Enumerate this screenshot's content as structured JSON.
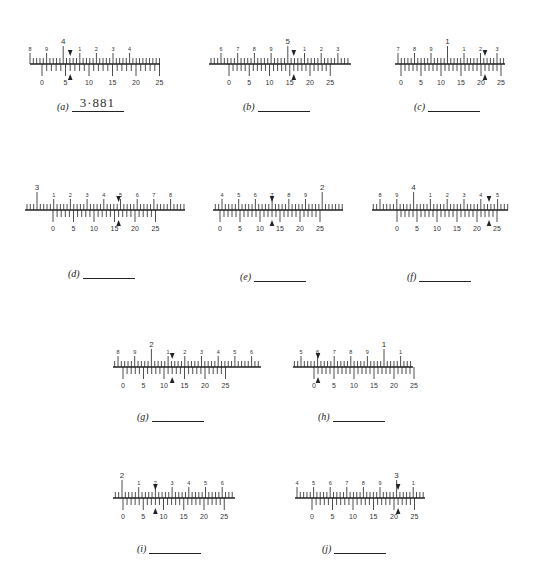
{
  "figure": {
    "colors": {
      "ink": "#222222",
      "background": "#ffffff"
    }
  },
  "panels": [
    {
      "id": "a",
      "caption": "(a)",
      "answer": "3·881",
      "main_labels": [
        "8",
        "9",
        "4",
        "1",
        "2",
        "3",
        "4"
      ],
      "major_label": "4",
      "major_index": 2,
      "vernier_labels": [
        "0",
        "5",
        "10",
        "15",
        "20",
        "25"
      ],
      "arrow_at_vernier": 6
    },
    {
      "id": "b",
      "caption": "(b)",
      "answer": "",
      "main_labels": [
        "6",
        "7",
        "8",
        "9",
        "5",
        "1",
        "2",
        "3"
      ],
      "major_label": "5",
      "major_index": 4,
      "vernier_labels": [
        "0",
        "5",
        "10",
        "15",
        "20",
        "25"
      ],
      "arrow_at_vernier": 16
    },
    {
      "id": "c",
      "caption": "(c)",
      "answer": "",
      "main_labels": [
        "7",
        "8",
        "9",
        "1",
        "1",
        "2",
        "3"
      ],
      "major_label": "1",
      "major_index": 3,
      "vernier_labels": [
        "0",
        "5",
        "10",
        "15",
        "20",
        "25"
      ],
      "arrow_at_vernier": 21
    },
    {
      "id": "d",
      "caption": "(d)",
      "answer": "",
      "main_labels": [
        "3",
        "1",
        "2",
        "3",
        "4",
        "5",
        "6",
        "7",
        "8"
      ],
      "major_label": "3",
      "major_index": 0,
      "vernier_labels": [
        "0",
        "5",
        "10",
        "15",
        "20",
        "25"
      ],
      "arrow_at_vernier": 16
    },
    {
      "id": "e",
      "caption": "(e)",
      "answer": "",
      "main_labels": [
        "4",
        "5",
        "6",
        "7",
        "8",
        "9",
        "2"
      ],
      "major_label": "2",
      "major_index": 6,
      "vernier_labels": [
        "0",
        "5",
        "10",
        "15",
        "20",
        "25"
      ],
      "arrow_at_vernier": 13
    },
    {
      "id": "f",
      "caption": "(f)",
      "answer": "",
      "main_labels": [
        "8",
        "9",
        "4",
        "1",
        "2",
        "3",
        "4",
        "5"
      ],
      "major_label": "4",
      "major_index": 2,
      "vernier_labels": [
        "0",
        "5",
        "10",
        "15",
        "20",
        "25"
      ],
      "arrow_at_vernier": 23
    },
    {
      "id": "g",
      "caption": "(g)",
      "answer": "",
      "main_labels": [
        "8",
        "9",
        "2",
        "1",
        "2",
        "3",
        "4",
        "5",
        "6"
      ],
      "major_label": "2",
      "major_index": 2,
      "vernier_labels": [
        "0",
        "5",
        "10",
        "15",
        "20",
        "25"
      ],
      "arrow_at_vernier": 12
    },
    {
      "id": "h",
      "caption": "(h)",
      "answer": "",
      "main_labels": [
        "5",
        "6",
        "7",
        "8",
        "9",
        "1",
        "1"
      ],
      "major_label": "1",
      "major_index": 5,
      "vernier_labels": [
        "0",
        "5",
        "10",
        "15",
        "20",
        "25"
      ],
      "arrow_at_vernier": 1
    },
    {
      "id": "i",
      "caption": "(i)",
      "answer": "",
      "main_labels": [
        "2",
        "1",
        "2",
        "3",
        "4",
        "5",
        "6"
      ],
      "major_label": "2",
      "major_index": 0,
      "vernier_labels": [
        "0",
        "5",
        "10",
        "15",
        "20",
        "25"
      ],
      "arrow_at_vernier": 8
    },
    {
      "id": "j",
      "caption": "(j)",
      "answer": "",
      "main_labels": [
        "4",
        "5",
        "6",
        "7",
        "8",
        "9",
        "3",
        "1"
      ],
      "major_label": "3",
      "major_index": 6,
      "vernier_labels": [
        "0",
        "5",
        "10",
        "15",
        "20",
        "25"
      ],
      "arrow_at_vernier": 21
    }
  ]
}
